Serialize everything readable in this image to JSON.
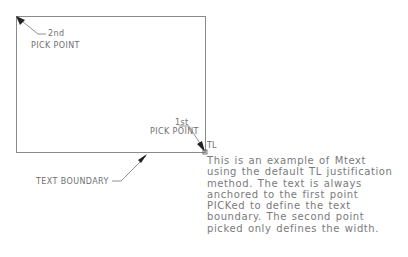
{
  "diagram": {
    "colors": {
      "line": "#8a8a8a",
      "text": "#707070",
      "arrow": "#222222",
      "background": "#ffffff"
    },
    "boundary_rect": {
      "x": 16,
      "y": 16,
      "width": 189,
      "height": 136
    },
    "labels": {
      "second_pick_line1": "2nd",
      "second_pick_line2": "PICK  POINT",
      "first_pick_line1": "1st",
      "first_pick_line2": "PICK  POINT",
      "justification": "TL",
      "text_boundary": "TEXT  BOUNDARY"
    },
    "mtext_lines": [
      "This is an example of Mtext",
      "using the default TL justification",
      "method.  The text is always",
      "anchored to the first point",
      "PICKed to define the text",
      "boundary.  The second point",
      "picked only defines the width."
    ],
    "icons": {
      "second_pick_arrow": "arrowhead",
      "first_pick_arrow": "arrowhead",
      "boundary_arrow": "arrowhead",
      "insertion_grip": "square-grip"
    }
  }
}
